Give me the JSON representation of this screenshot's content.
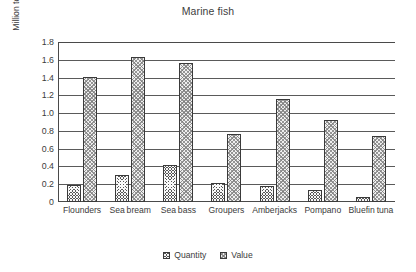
{
  "chart_data": {
    "type": "bar",
    "title": "Marine fish",
    "xlabel": "",
    "ylabel": "Million tonnes, billion US dollars",
    "ylim": [
      0,
      1.8
    ],
    "ytick_step": 0.2,
    "yticks": [
      "0",
      "0.2",
      "0.4",
      "0.6",
      "0.8",
      "1.0",
      "1.2",
      "1.4",
      "1.6",
      "1.8"
    ],
    "grid": true,
    "legend_position": "bottom-center",
    "categories": [
      "Flounders",
      "Sea bream",
      "Sea bass",
      "Groupers",
      "Amberjacks",
      "Pompano",
      "Bluefin tuna"
    ],
    "series": [
      {
        "name": "Quantity",
        "pattern": "dark-checkered",
        "color": "#575757",
        "values": [
          0.19,
          0.3,
          0.42,
          0.21,
          0.18,
          0.14,
          0.06
        ]
      },
      {
        "name": "Value",
        "pattern": "light-dotted",
        "color": "#efefef",
        "values": [
          1.41,
          1.63,
          1.56,
          0.77,
          1.16,
          0.92,
          0.74
        ]
      }
    ]
  },
  "legend": {
    "items": [
      {
        "label": "Quantity"
      },
      {
        "label": "Value"
      }
    ]
  }
}
